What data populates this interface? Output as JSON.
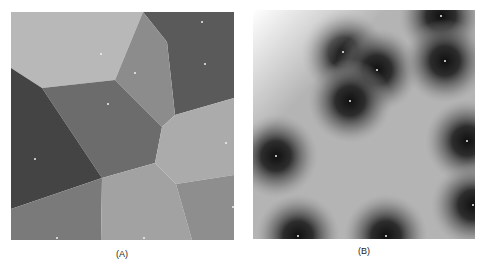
{
  "figure": {
    "panels": [
      {
        "id": "A",
        "label": "(A)",
        "type": "voronoi-diagram",
        "cells": [
          {
            "name": "top-left",
            "fill": "#b8b8b8",
            "points": "0,0 132,0 104,68 31,76 0,56"
          },
          {
            "name": "top-right",
            "fill": "#5a5a5a",
            "points": "132,0 223,0 223,86 164,103 156,30"
          },
          {
            "name": "upper-middle",
            "fill": "#8c8c8c",
            "points": "132,0 156,30 164,103 151,115 104,68"
          },
          {
            "name": "center",
            "fill": "#6c6c6c",
            "points": "31,76 104,68 151,115 144,151 91,166"
          },
          {
            "name": "left",
            "fill": "#444444",
            "points": "0,56 31,76 91,166 0,197"
          },
          {
            "name": "right",
            "fill": "#ababab",
            "points": "164,103 223,86 223,163 165,172 144,151 151,115"
          },
          {
            "name": "bottom-left",
            "fill": "#7a7a7a",
            "points": "0,197 91,166 90,228 0,228"
          },
          {
            "name": "bottom-center",
            "fill": "#a2a2a2",
            "points": "91,166 144,151 165,172 181,228 90,228"
          },
          {
            "name": "bottom-right",
            "fill": "#8e8e8e",
            "points": "165,172 223,163 223,228 181,228"
          }
        ],
        "seeds": [
          [
            90,
            42
          ],
          [
            191,
            10
          ],
          [
            194,
            52
          ],
          [
            124,
            61
          ],
          [
            97,
            92
          ],
          [
            24,
            147
          ],
          [
            215,
            131
          ],
          [
            222,
            195
          ],
          [
            46,
            226
          ],
          [
            133,
            226
          ]
        ]
      },
      {
        "id": "B",
        "label": "(B)",
        "type": "distance-transform",
        "background": "#e6e6e6",
        "seeds": [
          [
            188,
            6
          ],
          [
            90,
            42
          ],
          [
            124,
            60
          ],
          [
            192,
            51
          ],
          [
            97,
            91
          ],
          [
            23,
            146
          ],
          [
            214,
            131
          ],
          [
            220,
            195
          ],
          [
            45,
            226
          ],
          [
            133,
            226
          ]
        ]
      }
    ]
  }
}
